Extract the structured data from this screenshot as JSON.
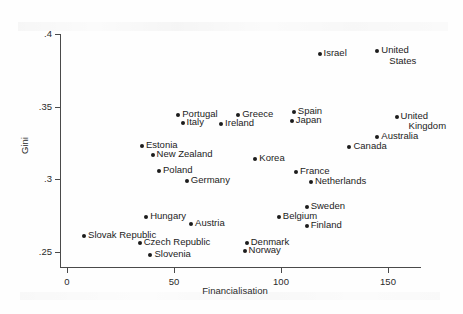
{
  "chart_data": {
    "type": "scatter",
    "title": "",
    "xlabel": "Financialisation",
    "ylabel": "Gini",
    "xlim": [
      -5,
      165
    ],
    "ylim": [
      0.243,
      0.403
    ],
    "xticks": [
      0,
      50,
      100,
      150
    ],
    "xticklabels": [
      "0",
      "50",
      "100",
      "150"
    ],
    "yticks": [
      0.25,
      0.3,
      0.35,
      0.4
    ],
    "yticklabels": [
      ".25",
      ".3",
      ".35",
      ".4"
    ],
    "grid": false,
    "legend": false,
    "points": [
      {
        "label": "Israel",
        "x": 118,
        "y": 0.386,
        "label_pos": "right"
      },
      {
        "label": "United\nStates",
        "x": 145,
        "y": 0.388,
        "label_pos": "right"
      },
      {
        "label": "Portugal",
        "x": 52,
        "y": 0.344,
        "label_pos": "right"
      },
      {
        "label": "Italy",
        "x": 54,
        "y": 0.339,
        "label_pos": "right"
      },
      {
        "label": "Spain",
        "x": 106,
        "y": 0.346,
        "label_pos": "right"
      },
      {
        "label": "Japan",
        "x": 105,
        "y": 0.34,
        "label_pos": "right"
      },
      {
        "label": "United\nKingdom",
        "x": 154,
        "y": 0.343,
        "label_pos": "right"
      },
      {
        "label": "Greece",
        "x": 80,
        "y": 0.344,
        "label_pos": "right"
      },
      {
        "label": "Ireland",
        "x": 72,
        "y": 0.338,
        "label_pos": "right"
      },
      {
        "label": "Australia",
        "x": 145,
        "y": 0.329,
        "label_pos": "right"
      },
      {
        "label": "Canada",
        "x": 132,
        "y": 0.322,
        "label_pos": "right"
      },
      {
        "label": "Estonia",
        "x": 35,
        "y": 0.323,
        "label_pos": "right"
      },
      {
        "label": "New Zealand",
        "x": 40,
        "y": 0.317,
        "label_pos": "right"
      },
      {
        "label": "Korea",
        "x": 88,
        "y": 0.314,
        "label_pos": "right"
      },
      {
        "label": "Poland",
        "x": 43,
        "y": 0.306,
        "label_pos": "right"
      },
      {
        "label": "France",
        "x": 107,
        "y": 0.305,
        "label_pos": "right"
      },
      {
        "label": "Netherlands",
        "x": 114,
        "y": 0.298,
        "label_pos": "right"
      },
      {
        "label": "Germany",
        "x": 56,
        "y": 0.299,
        "label_pos": "right"
      },
      {
        "label": "Sweden",
        "x": 112,
        "y": 0.281,
        "label_pos": "right"
      },
      {
        "label": "Hungary",
        "x": 37,
        "y": 0.274,
        "label_pos": "right"
      },
      {
        "label": "Austria",
        "x": 58,
        "y": 0.269,
        "label_pos": "right"
      },
      {
        "label": "Belgium",
        "x": 99,
        "y": 0.274,
        "label_pos": "right"
      },
      {
        "label": "Slovak Republic",
        "x": 8,
        "y": 0.261,
        "label_pos": "right"
      },
      {
        "label": "Czech Republic",
        "x": 34,
        "y": 0.256,
        "label_pos": "right"
      },
      {
        "label": "Finland",
        "x": 112,
        "y": 0.268,
        "label_pos": "right"
      },
      {
        "label": "Denmark",
        "x": 84,
        "y": 0.256,
        "label_pos": "right"
      },
      {
        "label": "Norway",
        "x": 83,
        "y": 0.251,
        "label_pos": "right"
      },
      {
        "label": "Slovenia",
        "x": 39,
        "y": 0.248,
        "label_pos": "right"
      }
    ]
  }
}
